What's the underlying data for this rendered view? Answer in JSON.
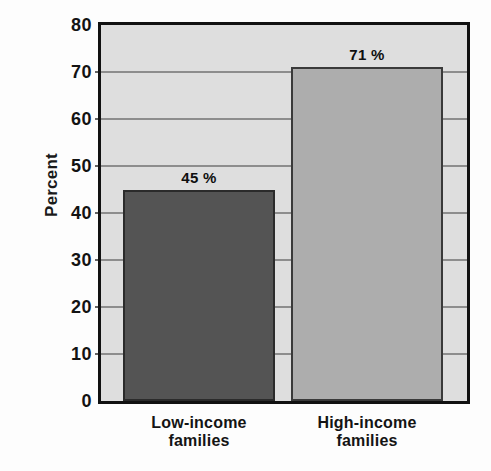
{
  "chart_data": {
    "type": "bar",
    "title": "",
    "xlabel": "",
    "ylabel": "Percent",
    "ylim": [
      0,
      80
    ],
    "yticks": [
      0,
      10,
      20,
      30,
      40,
      50,
      60,
      70,
      80
    ],
    "ytick_labels": [
      "0",
      "10",
      "20",
      "30",
      "40",
      "50",
      "60",
      "70",
      "80"
    ],
    "grid": true,
    "grid_axis": "y",
    "legend": false,
    "categories": [
      "Low-income families",
      "High-income families"
    ],
    "category_label_lines": [
      [
        "Low-income",
        "families"
      ],
      [
        "High-income",
        "families"
      ]
    ],
    "values": [
      45,
      71
    ],
    "value_labels": [
      "45 %",
      "71 %"
    ],
    "bar_colors": [
      "#545454",
      "#adadad"
    ],
    "plot_background": "#dedede",
    "axis_color": "#111111",
    "gridline_color": "#8d8d8d"
  }
}
